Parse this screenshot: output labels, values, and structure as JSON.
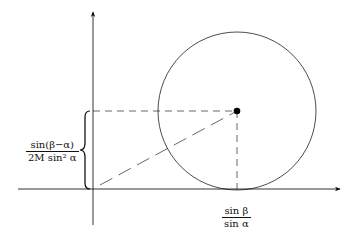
{
  "diagram": {
    "type": "geometry",
    "colors": {
      "stroke": "#000000",
      "axis": "#000000",
      "background": "#ffffff"
    },
    "axes": {
      "x_axis": {
        "from": [
          18,
          189
        ],
        "to": [
          340,
          189
        ],
        "arrow": true
      },
      "y_axis": {
        "from": [
          93,
          225
        ],
        "to": [
          93,
          12
        ],
        "arrow": true
      }
    },
    "circle": {
      "cx": 237,
      "cy": 111,
      "r": 79
    },
    "center_point": {
      "x": 237,
      "y": 111
    },
    "dashed_lines": [
      {
        "name": "horizontal-to-y-axis",
        "from": [
          93,
          111
        ],
        "to": [
          237,
          111
        ]
      },
      {
        "name": "vertical-to-x-axis",
        "from": [
          237,
          111
        ],
        "to": [
          237,
          189
        ]
      },
      {
        "name": "origin-to-center",
        "from": [
          93,
          189
        ],
        "to": [
          237,
          111
        ]
      }
    ],
    "brace": {
      "x": 86,
      "from_y": 111,
      "to_y": 189
    },
    "labels": {
      "y_label": {
        "numerator": "sin(β−α)",
        "denominator": "2M sin² α"
      },
      "x_label": {
        "numerator": "sin β",
        "denominator": "sin α"
      }
    }
  }
}
